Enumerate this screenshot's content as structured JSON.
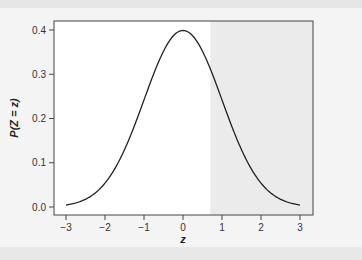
{
  "chart_data": {
    "type": "line",
    "title": "",
    "xlabel": "z",
    "ylabel": "P(Z = z)",
    "xlim": [
      -3,
      3
    ],
    "ylim": [
      0.0,
      0.4
    ],
    "x_ticks": [
      "-3",
      "-2",
      "-1",
      "0",
      "1",
      "2",
      "3"
    ],
    "y_ticks": [
      "0.0",
      "0.1",
      "0.2",
      "0.3",
      "0.4"
    ],
    "grid": false,
    "legend": null,
    "series": [
      {
        "name": "standard normal density",
        "x": [
          -3,
          -2.5,
          -2,
          -1.5,
          -1,
          -0.5,
          0,
          0.5,
          1,
          1.5,
          2,
          2.5,
          3
        ],
        "y": [
          0.004,
          0.018,
          0.054,
          0.13,
          0.242,
          0.352,
          0.399,
          0.352,
          0.242,
          0.13,
          0.054,
          0.018,
          0.004
        ]
      }
    ],
    "shaded_region": {
      "x_from": 0.7,
      "x_to": 3,
      "color": "#ebebeb",
      "description": "upper tail area"
    },
    "colors": {
      "line": "#222222",
      "frame": "#444444",
      "shade": "#ebebeb"
    }
  }
}
